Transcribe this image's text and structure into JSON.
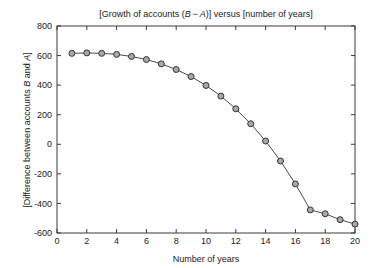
{
  "chart_data": {
    "type": "line",
    "title_parts": {
      "prefix": "[Growth of accounts (",
      "var_b": "B",
      "minus": " − ",
      "var_a": "A",
      "suffix": ")] versus [number of years]"
    },
    "xlabel": "Number of years",
    "ylabel": "[Difference between accounts B and A]",
    "ylabel_parts": {
      "prefix": "[Difference between accounts ",
      "var_b": "B",
      "middle": " and ",
      "var_a": "A",
      "suffix": "]"
    },
    "xlim": [
      0,
      20
    ],
    "ylim": [
      -600,
      800
    ],
    "xticks": [
      0,
      2,
      4,
      6,
      8,
      10,
      12,
      14,
      16,
      18,
      20
    ],
    "yticks": [
      -600,
      -400,
      -200,
      0,
      200,
      400,
      600,
      800
    ],
    "xtick_labels": [
      "0",
      "2",
      "4",
      "6",
      "8",
      "10",
      "12",
      "14",
      "16",
      "18",
      "20"
    ],
    "ytick_labels": [
      "-600",
      "-400",
      "-200",
      "0",
      "200",
      "400",
      "600",
      "800"
    ],
    "grid": false,
    "legend": false,
    "marker": "circle",
    "marker_face_color": "#a8a8a8",
    "marker_edge_color": "#333333",
    "line_color": "#4a4a4a",
    "x": [
      1,
      2,
      3,
      4,
      5,
      6,
      7,
      8,
      9,
      10,
      11,
      12,
      13,
      14,
      15,
      16,
      17,
      18,
      19,
      20
    ],
    "values": [
      615,
      618,
      615,
      608,
      594,
      573,
      544,
      506,
      458,
      398,
      326,
      240,
      139,
      22,
      -113,
      -268,
      -444,
      -642,
      -865,
      -540
    ],
    "series": [
      {
        "name": "B − A",
        "values": [
          615,
          618,
          615,
          608,
          594,
          573,
          544,
          506,
          458,
          398,
          326,
          240,
          139,
          22,
          -113,
          -268,
          -444,
          -470,
          -510,
          -540
        ]
      }
    ]
  },
  "plot_box": {
    "left": 57,
    "top": 26,
    "right": 355,
    "bottom": 233
  }
}
